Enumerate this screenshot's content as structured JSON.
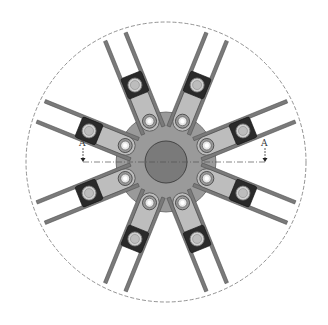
{
  "diagram": {
    "title": "",
    "type": "radial mechanical assembly (top view)",
    "center": {
      "x": 166,
      "y": 162
    },
    "outer_boundary": {
      "radius": 140,
      "style": "dashed",
      "color": "#777777"
    },
    "hub": {
      "radius": 21,
      "color": "#7a7a7a",
      "stroke": "#444444"
    },
    "base_disk": {
      "radius": 50,
      "color": "#9a9a9a",
      "stroke": "#666666"
    },
    "arm_count": 8,
    "arm_angles_deg": [
      -112,
      -68,
      -22,
      22,
      68,
      112,
      158,
      202
    ],
    "arm": {
      "link_color": "#bdbdbd",
      "link_stroke": "#555555",
      "block_color": "#2a2a2a",
      "bolt_color": "#d0d0d0",
      "rod_color": "#7a7a7a",
      "rod_length": 135,
      "inner_bolt_radius": 44,
      "block_radius": 83
    },
    "section": {
      "label_left": "A",
      "label_right": "A",
      "line_style": "dash-dot",
      "y": 162,
      "x_left": 83,
      "x_right": 265
    }
  }
}
